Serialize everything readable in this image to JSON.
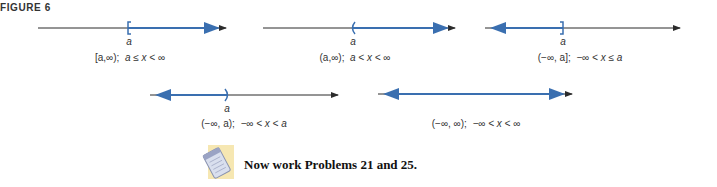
{
  "figure": {
    "label": "FIGURE 6",
    "point_label": "a",
    "colors": {
      "axis": "#2b2b2b",
      "highlight": "#3a6fb0"
    },
    "intervals": [
      {
        "id": "closed-right-infinite",
        "notation": "[a,∞);",
        "inequality": "a ≤ x < ∞",
        "endpoint_mark": "["
      },
      {
        "id": "open-right-infinite",
        "notation": "(a,∞);",
        "inequality": "a < x < ∞",
        "endpoint_mark": "("
      },
      {
        "id": "left-infinite-closed",
        "notation": "(−∞, a];",
        "inequality": "−∞ < x ≤ a",
        "endpoint_mark": "]"
      },
      {
        "id": "left-infinite-open",
        "notation": "(−∞, a);",
        "inequality": "−∞ < x < a",
        "endpoint_mark": ")"
      },
      {
        "id": "all-reals",
        "notation": "(−∞, ∞);",
        "inequality": "−∞ < x < ∞",
        "endpoint_mark": ""
      }
    ]
  },
  "note": {
    "icon": "notepad-icon",
    "text": "Now work Problems 21 and 25."
  }
}
